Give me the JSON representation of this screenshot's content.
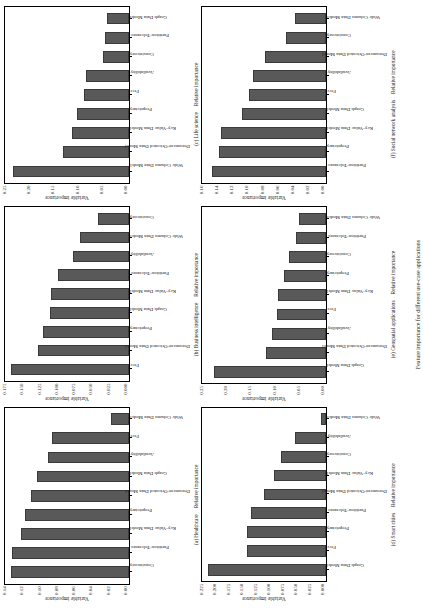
{
  "figure": {
    "caption": "Feature importance for different use-case applications",
    "bar_color": "#595959",
    "axis_color": "#000000",
    "y_axis_title": "Variable importance",
    "x_axis_title": "Relative importance"
  },
  "chart_data": [
    {
      "type": "bar",
      "panel_id": "a",
      "title": "(a) Healthcare",
      "xlabel": "Relative importance",
      "ylabel": "Variable importance",
      "ylim": [
        0.0,
        0.15
      ],
      "ticks": [
        "0.00",
        "0.02",
        "0.04",
        "0.06",
        "0.08",
        "0.10",
        "0.12",
        "0.14"
      ],
      "categories": [
        "Consistency",
        "Partition-Tolerance",
        "Key-Value Data Model",
        "Proprietary",
        "Document-Oriented Data Model",
        "Graph Data Model",
        "Availability",
        "Free",
        "Wide Column Data Model"
      ],
      "values": [
        0.143,
        0.141,
        0.131,
        0.126,
        0.118,
        0.111,
        0.098,
        0.093,
        0.022
      ]
    },
    {
      "type": "bar",
      "panel_id": "b",
      "title": "(b) Business intelligence",
      "xlabel": "Relative importance",
      "ylabel": "Variable importance",
      "ylim": [
        0.0,
        0.185
      ],
      "ticks": [
        "0.000",
        "0.025",
        "0.050",
        "0.075",
        "0.100",
        "0.125",
        "0.150",
        "0.175"
      ],
      "categories": [
        "Free",
        "Document-Oriented Data Model",
        "Proprietary",
        "Graph Data Model",
        "Key-Value Data Model",
        "Partition-Tolerance",
        "Availability",
        "Wide Column Data Model",
        "Consistency"
      ],
      "values": [
        0.176,
        0.136,
        0.128,
        0.118,
        0.117,
        0.106,
        0.083,
        0.073,
        0.047
      ]
    },
    {
      "type": "bar",
      "panel_id": "c",
      "title": "(c) Life science",
      "xlabel": "Relative importance",
      "ylabel": "Variable importance",
      "ylim": [
        0.0,
        0.27
      ],
      "ticks": [
        "0.00",
        "0.05",
        "0.10",
        "0.15",
        "0.20",
        "0.25"
      ],
      "categories": [
        "Wide Column Data Model",
        "Document-Oriented Data Model",
        "Key-Value Data Model",
        "Proprietary",
        "Free",
        "Availability",
        "Consistency",
        "Partition-Tolerance",
        "Graph Data Model"
      ],
      "values": [
        0.253,
        0.143,
        0.124,
        0.113,
        0.098,
        0.094,
        0.057,
        0.053,
        0.049
      ]
    },
    {
      "type": "bar",
      "panel_id": "d",
      "title": "(d) Smart cities",
      "xlabel": "Relative importance",
      "ylabel": "Variable importance",
      "ylim": [
        0.0,
        0.235
      ],
      "ticks": [
        "0.000",
        "0.025",
        "0.050",
        "0.075",
        "0.100",
        "0.125",
        "0.150",
        "0.175",
        "0.200",
        "0.225"
      ],
      "categories": [
        "Graph Data Model",
        "Free",
        "Proprietary",
        "Partition-Tolerance",
        "Document-Oriented Data Model",
        "Key-Value Data Model",
        "Consistency",
        "Availability",
        "Wide Column Data Model"
      ],
      "values": [
        0.224,
        0.15,
        0.149,
        0.143,
        0.117,
        0.098,
        0.085,
        0.058,
        0.01
      ]
    },
    {
      "type": "bar",
      "panel_id": "e",
      "title": "(e) Geospatial applications",
      "xlabel": "Relative importance",
      "ylabel": "Variable importance",
      "ylim": [
        0.0,
        0.265
      ],
      "ticks": [
        "0.00",
        "0.05",
        "0.10",
        "0.15",
        "0.20",
        "0.25"
      ],
      "categories": [
        "Graph Data Model",
        "Document-Oriented Data Model",
        "Availability",
        "Free",
        "Key-Value Data Model",
        "Proprietary",
        "Consistency",
        "Partition-Tolerance",
        "Wide Column Data Model"
      ],
      "values": [
        0.24,
        0.128,
        0.115,
        0.105,
        0.102,
        0.09,
        0.08,
        0.065,
        0.058
      ]
    },
    {
      "type": "bar",
      "panel_id": "f",
      "title": "(f) Social network analysis",
      "xlabel": "Relative importance",
      "ylabel": "Variable importance",
      "ylim": [
        0.0,
        0.172
      ],
      "ticks": [
        "0.00",
        "0.02",
        "0.04",
        "0.06",
        "0.08",
        "0.10",
        "0.12",
        "0.14",
        "0.16"
      ],
      "categories": [
        "Partition-Tolerance",
        "Proprietary",
        "Key-Value Data Model",
        "Graph Data Model",
        "Free",
        "Availability",
        "Document-Oriented Data Model",
        "Consistency",
        "Wide Column Data Model"
      ],
      "values": [
        0.158,
        0.148,
        0.146,
        0.117,
        0.107,
        0.101,
        0.084,
        0.056,
        0.043
      ]
    }
  ]
}
